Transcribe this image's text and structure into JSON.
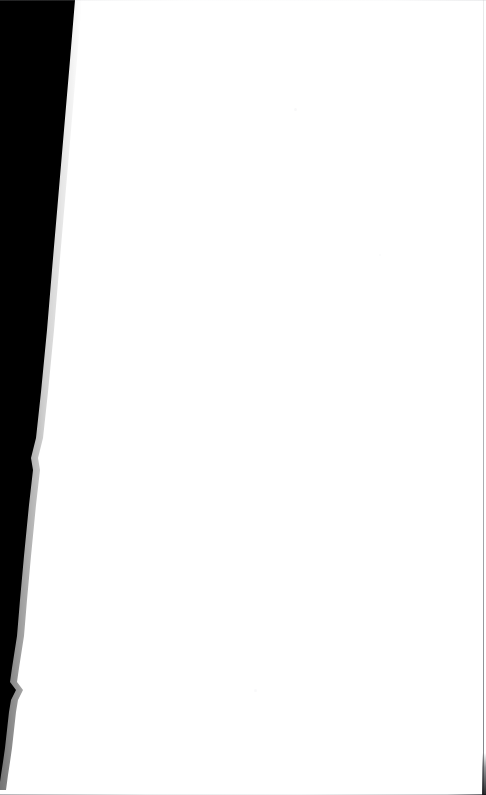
{
  "page": {
    "kind": "scanned-page",
    "width": 486,
    "height": 795,
    "background_color": "#ffffff",
    "text_content": "",
    "visible_text_present": false
  },
  "colors": {
    "paper": "#ffffff",
    "shadow": "#000000",
    "trim_line": "#8e9096",
    "speck": "#96989e"
  },
  "gutter_shadow": {
    "name": "left-gutter-shadow",
    "fill": "#000000",
    "outline_points": "0,0 75,0 70,60 64,130 58,200 52,270 47,330 41,392 36,438 31,458 33,470 29,505 24,556 20,600 17,636 12,668 10,682 16,690 11,700 9,712 7,730 5,748 3,762 1,775 0,782",
    "taper_note": "starts ~75px wide at top, tapers to 0 near y=775"
  },
  "penumbra": {
    "name": "gutter-shadow-penumbra",
    "opacity": 0.35
  },
  "trim_edges": {
    "right": {
      "name": "right-trim-edge",
      "x": 483,
      "color": "#8e9096"
    },
    "bottom": {
      "name": "bottom-trim-edge",
      "y": 794,
      "color": "#8e9096"
    },
    "top": {
      "name": "top-trim-edge",
      "y": 0,
      "color": "#c4c6ca"
    }
  },
  "corner_nick": {
    "name": "bottom-right-corner-nick",
    "color": "#14151a"
  },
  "specks": [
    {
      "name": "scan-speck-upper",
      "x": 294,
      "y": 108,
      "size": 3,
      "opacity": 0.22
    },
    {
      "name": "scan-speck-lower",
      "x": 254,
      "y": 689,
      "size": 3,
      "opacity": 0.18
    },
    {
      "name": "scan-speck-edge",
      "x": 379,
      "y": 254,
      "size": 2,
      "opacity": 0.14
    }
  ]
}
